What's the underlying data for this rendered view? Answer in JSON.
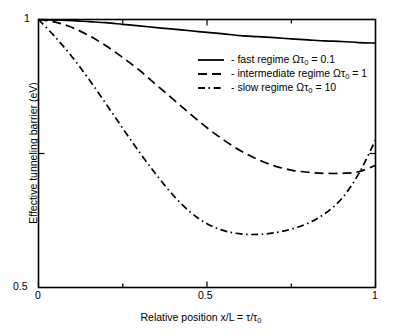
{
  "chart_data": {
    "type": "line",
    "title": "",
    "xlabel": "Relative position x/L = τ/τ₀",
    "ylabel": "Effective tunneling barrier (eV)",
    "xlim": [
      0,
      1
    ],
    "ylim": [
      0.5,
      1
    ],
    "grid": false,
    "legend_position": "top-right inside",
    "x_tick_labels": [
      "0",
      "0.5",
      "1"
    ],
    "x_tick_values": [
      0,
      0.5,
      1
    ],
    "y_tick_labels": [
      "0.5",
      "1"
    ],
    "y_tick_values": [
      0.5,
      1
    ],
    "x": [
      0,
      0.05,
      0.1,
      0.15,
      0.2,
      0.25,
      0.3,
      0.35,
      0.4,
      0.45,
      0.5,
      0.55,
      0.6,
      0.65,
      0.7,
      0.75,
      0.8,
      0.85,
      0.9,
      0.95,
      1
    ],
    "series": [
      {
        "name": "fast regime Ωτ₀ = 0.1",
        "label_prefix": "-",
        "dash": "solid",
        "color": "#000000",
        "values": [
          1.0,
          0.999,
          0.998,
          0.996,
          0.994,
          0.991,
          0.988,
          0.985,
          0.982,
          0.979,
          0.976,
          0.973,
          0.97,
          0.968,
          0.966,
          0.964,
          0.962,
          0.96,
          0.959,
          0.957,
          0.956
        ]
      },
      {
        "name": "intermediate regime Ωτ₀ = 1",
        "label_prefix": "-",
        "dash": "dashed",
        "color": "#000000",
        "values": [
          1.0,
          0.995,
          0.985,
          0.97,
          0.951,
          0.929,
          0.905,
          0.878,
          0.851,
          0.824,
          0.798,
          0.775,
          0.755,
          0.739,
          0.727,
          0.719,
          0.715,
          0.713,
          0.713,
          0.716,
          0.728
        ]
      },
      {
        "name": "slow regime Ωτ₀ = 10",
        "label_prefix": "-",
        "dash": "dashdot",
        "color": "#000000",
        "values": [
          1.0,
          0.967,
          0.93,
          0.888,
          0.843,
          0.797,
          0.752,
          0.71,
          0.672,
          0.641,
          0.619,
          0.606,
          0.6,
          0.599,
          0.602,
          0.609,
          0.62,
          0.638,
          0.666,
          0.712,
          0.775
        ]
      }
    ]
  },
  "axes": {
    "x_title": "Relative position x/L = τ/τ",
    "x_title_sub": "0",
    "y_title": "Effective tunneling barrier (eV)",
    "x_ticks": {
      "zero": "0",
      "half": "0.5",
      "one": "1"
    },
    "y_ticks": {
      "bottom": "0.5",
      "top": "1"
    }
  },
  "legend": {
    "entries": [
      {
        "dash": "solid",
        "prefix": "-",
        "text": "fast regime Ωτ",
        "sub": "0",
        "suffix": " = 0.1"
      },
      {
        "dash": "dashed",
        "prefix": "-",
        "text": "intermediate regime Ωτ",
        "sub": "0",
        "suffix": " = 1"
      },
      {
        "dash": "dashdot",
        "prefix": "-",
        "text": "slow regime Ωτ",
        "sub": "0",
        "suffix": " = 10"
      }
    ]
  }
}
